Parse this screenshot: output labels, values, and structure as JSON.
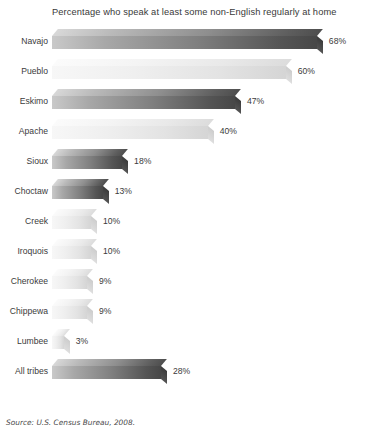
{
  "chart_data": {
    "type": "bar",
    "orientation": "horizontal",
    "title": "Percentage who speak at least some non-English regularly at home",
    "xlabel": "",
    "ylabel": "",
    "unit": "%",
    "xlim": [
      0,
      68
    ],
    "grid": false,
    "legend": null,
    "categories": [
      "Navajo",
      "Pueblo",
      "Eskimo",
      "Apache",
      "Sioux",
      "Choctaw",
      "Creek",
      "Iroquois",
      "Cherokee",
      "Chippewa",
      "Lumbee",
      "All tribes"
    ],
    "values": [
      68,
      60,
      47,
      40,
      18,
      13,
      10,
      10,
      9,
      9,
      3,
      28
    ],
    "value_labels": [
      "68%",
      "60%",
      "47%",
      "40%",
      "18%",
      "13%",
      "10%",
      "10%",
      "9%",
      "9%",
      "3%",
      "28%"
    ],
    "bar_styles": [
      "dark",
      "light",
      "dark",
      "light",
      "dark",
      "dark",
      "light",
      "light",
      "light",
      "light",
      "light",
      "dark"
    ],
    "source": "Source: U.S. Census Bureau, 2008."
  },
  "colors": {
    "background": "#ffffff",
    "text": "#3b3b3b",
    "bar_dark_start": "#c9c9c9",
    "bar_dark_end": "#474747",
    "bar_light_start": "#f7f7f7",
    "bar_light_end": "#d5d5d5"
  }
}
